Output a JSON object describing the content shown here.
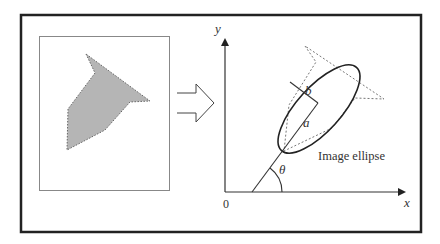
{
  "diagram": {
    "arrow_symbol": "transform-arrow",
    "axes": {
      "y_label": "y",
      "x_label": "x",
      "origin_label": "0"
    },
    "labels": {
      "semi_major": "a",
      "semi_minor": "b",
      "angle": "θ",
      "ellipse_caption": "Image ellipse"
    },
    "colors": {
      "frame": "#222222",
      "shape_fill": "#b5b5b5",
      "dotted_outline": "#777777",
      "line": "#333333"
    }
  }
}
